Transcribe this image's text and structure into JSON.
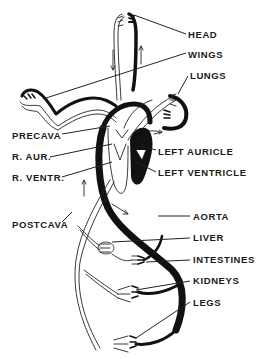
{
  "diagram": {
    "labels": {
      "head": "HEAD",
      "wings": "WINGS",
      "lungs": "LUNGS",
      "precava": "PRECAVA",
      "r_aur": "R. AUR.",
      "left_auricle": "LEFT AURICLE",
      "r_ventr": "R. VENTR.",
      "left_ventricle": "LEFT VENTRICLE",
      "postcava": "POSTCAVA",
      "aorta": "AORTA",
      "liver": "LIVER",
      "intestines": "INTESTINES",
      "kidneys": "KIDNEYS",
      "legs": "LEGS"
    },
    "colors": {
      "arterial": "#111111",
      "venous_outline": "#222222",
      "background": "#ffffff"
    }
  }
}
